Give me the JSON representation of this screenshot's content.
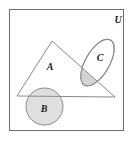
{
  "figure": {
    "kind": "euler-set-diagram",
    "width": 130,
    "height": 141,
    "background": "#ffffff"
  },
  "universe": {
    "label": "U",
    "label_x": 118,
    "label_y": 23,
    "rect": {
      "x": 9,
      "y": 9,
      "width": 115,
      "height": 122
    },
    "stroke": "#6e6e6e",
    "fill": "#ffffff",
    "stroke_width": 1
  },
  "sets": [
    {
      "id": "A",
      "label": "A",
      "shape": "triangle",
      "label_x": 50,
      "label_y": 70,
      "points": "52,41 115,97 17,96",
      "stroke": "#8a8a8a",
      "fill": "none",
      "stroke_width": 1
    },
    {
      "id": "B",
      "label": "B",
      "shape": "circle",
      "label_x": 44,
      "label_y": 112,
      "cx": 44.5,
      "cy": 106.5,
      "r": 18.5,
      "stroke": "#8a8a8a",
      "fill": "#d9d9d9",
      "fill_opacity": 0.85,
      "stroke_width": 1
    },
    {
      "id": "C",
      "label": "C",
      "shape": "ellipse",
      "label_x": 100,
      "label_y": 61,
      "cx": 97.5,
      "cy": 62.5,
      "rx": 12,
      "ry": 26,
      "rotation_deg": 30,
      "stroke": "#8a8a8a",
      "fill": "none",
      "stroke_width": 1
    }
  ],
  "intersections": [
    {
      "id": "A-and-C",
      "description": "shaded overlap of triangle A and ellipse C",
      "fill": "#cfcfcf",
      "fill_opacity": 0.9
    }
  ],
  "colors": {
    "outline": "#6e6e6e",
    "shape_outline": "#8a8a8a",
    "shade_light": "#d9d9d9",
    "shade_mid": "#cfcfcf",
    "text": "#1a1a1a",
    "background": "#ffffff"
  }
}
